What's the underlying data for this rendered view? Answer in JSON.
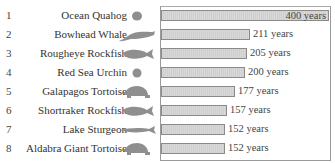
{
  "chart_data": {
    "type": "bar",
    "orientation": "horizontal",
    "title": "",
    "xlabel": "",
    "ylabel": "",
    "categories": [
      "Ocean Quahog",
      "Bowhead Whale",
      "Rougheye Rockfish",
      "Red Sea Urchin",
      "Galapagos Tortoise",
      "Shortraker Rockfish",
      "Lake Sturgeon",
      "Aldabra Giant Tortoise"
    ],
    "ranks": [
      1,
      2,
      3,
      4,
      5,
      6,
      7,
      8
    ],
    "values": [
      400,
      211,
      205,
      200,
      177,
      157,
      152,
      152
    ],
    "value_labels": [
      "400 years",
      "211 years",
      "205 years",
      "200 years",
      "177 years",
      "157 years",
      "152 years",
      "152 years"
    ],
    "unit": "years",
    "xlim": [
      0,
      400
    ],
    "grid": false,
    "legend": null
  },
  "rows": [
    {
      "rank": "1",
      "name": "Ocean Quahog",
      "value": "400 years",
      "icon": "clam-icon"
    },
    {
      "rank": "2",
      "name": "Bowhead Whale",
      "value": "211 years",
      "icon": "whale-icon"
    },
    {
      "rank": "3",
      "name": "Rougheye Rockfish",
      "value": "205 years",
      "icon": "fish-icon"
    },
    {
      "rank": "4",
      "name": "Red Sea Urchin",
      "value": "200 years",
      "icon": "urchin-icon"
    },
    {
      "rank": "5",
      "name": "Galapagos Tortoise",
      "value": "177 years",
      "icon": "tortoise-icon"
    },
    {
      "rank": "6",
      "name": "Shortraker Rockfish",
      "value": "157 years",
      "icon": "fish-icon"
    },
    {
      "rank": "7",
      "name": "Lake Sturgeon",
      "value": "152 years",
      "icon": "sturgeon-icon"
    },
    {
      "rank": "8",
      "name": "Aldabra Giant Tortoise",
      "value": "152 years",
      "icon": "tortoise-icon"
    }
  ],
  "colors": {
    "bar_fill": "#d4d4d4",
    "bar_border": "#8a8a8a",
    "icon": "#8f8f8f",
    "text": "#333333"
  }
}
